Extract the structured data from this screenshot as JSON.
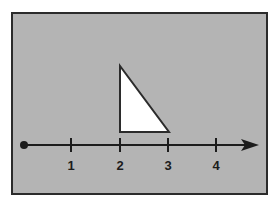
{
  "figure": {
    "canvas": {
      "width": 277,
      "height": 209,
      "background": "#ffffff"
    },
    "frame": {
      "name": "figure-frame",
      "x": 11,
      "y": 12,
      "width": 257,
      "height": 183,
      "fill": "#b4b4b4",
      "stroke": "#2b2b2b",
      "stroke_width": 2
    },
    "number_line": {
      "label": "number line",
      "axis_y": 145,
      "start_x": 23,
      "end_x": 259,
      "stroke": "#1c1c1c",
      "stroke_width": 2,
      "origin_dot": {
        "cx": 24,
        "cy": 145,
        "r": 4,
        "fill": "#1c1c1c"
      },
      "arrow_head": {
        "tip_x": 259,
        "back_x": 241,
        "half_height": 6,
        "fill": "#1c1c1c"
      },
      "tick_half_height": 7,
      "label_y": 166,
      "ticks": [
        {
          "label": "1",
          "x": 71
        },
        {
          "label": "2",
          "x": 120
        },
        {
          "label": "3",
          "x": 168
        },
        {
          "label": "4",
          "x": 216
        }
      ]
    },
    "triangle": {
      "label": "right triangle",
      "fill": "#ffffff",
      "stroke": "#2b2b2b",
      "stroke_width": 2,
      "points": "120,66 120,132 169,132",
      "vertices": [
        {
          "name": "apex",
          "x": 120,
          "y": 66
        },
        {
          "name": "bottom-left",
          "x": 120,
          "y": 132
        },
        {
          "name": "bottom-right",
          "x": 169,
          "y": 132
        }
      ]
    }
  },
  "chart_data": {
    "type": "line",
    "xlabel": "",
    "ylabel": "",
    "xlim": [
      0,
      4.8
    ],
    "grid": false,
    "legend": null,
    "tick_labels": [
      "1",
      "2",
      "3",
      "4"
    ],
    "tick_values": [
      1,
      2,
      3,
      4
    ],
    "annotations": [
      {
        "shape": "right-triangle",
        "description": "White right triangle with vertical leg at x=2 and horizontal leg from x=2 to x=3 resting on the number line",
        "base_from": 2,
        "base_to": 3,
        "base_length": 1,
        "height": 1.35,
        "right_angle_at": "bottom-left"
      },
      {
        "shape": "ray",
        "description": "Ray starting with a closed dot at x=0 and an arrowhead pointing right past x=4",
        "origin": 0,
        "direction": "right",
        "endpoint_type": "closed-dot"
      }
    ]
  }
}
